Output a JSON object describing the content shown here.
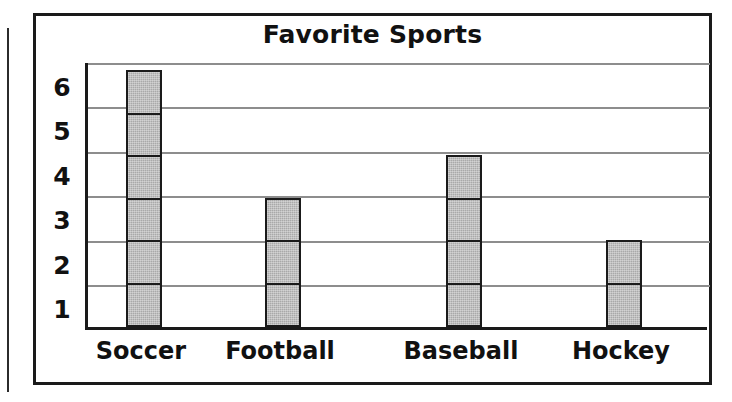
{
  "figure": {
    "title": "Favorite Sports",
    "frame_color": "#1a1a1a",
    "bar_fill_color": "#a9a9a9",
    "bar_border_color": "#1a1a1a",
    "gridline_color": "#8d8d8d",
    "background_color": "#ffffff"
  },
  "chart_data": {
    "type": "bar",
    "title": "Favorite Sports",
    "xlabel": "",
    "ylabel": "",
    "categories": [
      "Soccer",
      "Football",
      "Baseball",
      "Hockey"
    ],
    "values": [
      6,
      3,
      4,
      2
    ],
    "ytick_labels": [
      "1",
      "2",
      "3",
      "4",
      "5",
      "6"
    ],
    "ytick_values": [
      1,
      2,
      3,
      4,
      5,
      6
    ],
    "ylim": [
      0,
      6
    ],
    "grid": true,
    "grid_axis": "y",
    "legend": false,
    "bar_style": "stacked-unit-cells"
  }
}
